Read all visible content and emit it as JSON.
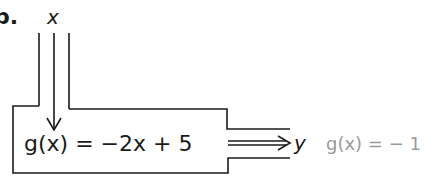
{
  "problem": {
    "label": "b.",
    "input_variable": "x",
    "function_expression": "g(x) = −2x + 5",
    "output_variable": "y",
    "answer_text": "g(x) = − 1"
  },
  "colors": {
    "ink": "#1a1a1a",
    "answer": "#9a9a9a",
    "background": "#ffffff"
  }
}
